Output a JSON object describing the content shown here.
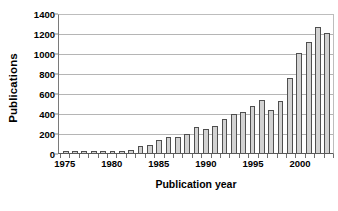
{
  "chart_data": {
    "type": "bar",
    "title": "",
    "xlabel": "Publication year",
    "ylabel": "Publications",
    "ylim": [
      0,
      1400
    ],
    "ytick_labels": [
      "0",
      "200",
      "400",
      "600",
      "800",
      "1000",
      "1200",
      "1400"
    ],
    "ytick_values": [
      0,
      200,
      400,
      600,
      800,
      1000,
      1200,
      1400
    ],
    "xtick_labels": [
      "1975",
      "1980",
      "1985",
      "1990",
      "1995",
      "2000"
    ],
    "xtick_values": [
      1975,
      1980,
      1985,
      1990,
      1995,
      2000
    ],
    "grid": true,
    "legend": "none",
    "bar_fill": "#d2d2d2",
    "bar_edge": "#4f4f4f",
    "categories": [
      "1975",
      "1976",
      "1977",
      "1978",
      "1979",
      "1980",
      "1981",
      "1982",
      "1983",
      "1984",
      "1985",
      "1986",
      "1987",
      "1988",
      "1989",
      "1990",
      "1991",
      "1992",
      "1993",
      "1994",
      "1995",
      "1996",
      "1997",
      "1998",
      "1999",
      "2000",
      "2001",
      "2002",
      "2003"
    ],
    "values": [
      25,
      20,
      22,
      24,
      22,
      24,
      22,
      35,
      75,
      80,
      130,
      160,
      160,
      190,
      260,
      240,
      275,
      340,
      390,
      410,
      470,
      530,
      435,
      525,
      750,
      1000,
      1110,
      1265,
      1200
    ]
  }
}
